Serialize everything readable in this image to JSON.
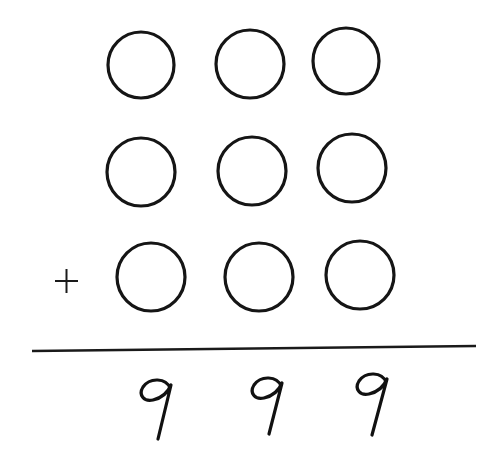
{
  "puzzle": {
    "operator": "+",
    "rows": [
      {
        "name": "addend-1",
        "digits": [
          "",
          "",
          ""
        ]
      },
      {
        "name": "addend-2",
        "digits": [
          "",
          "",
          ""
        ]
      },
      {
        "name": "addend-3",
        "digits": [
          "",
          "",
          ""
        ]
      }
    ],
    "result": [
      "9",
      "9",
      "9"
    ],
    "result_text": "999",
    "colors": {
      "ink": "#151515",
      "background": "#ffffff"
    }
  }
}
